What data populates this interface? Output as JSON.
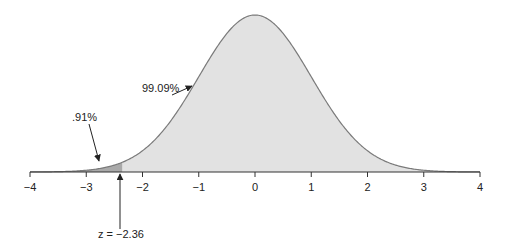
{
  "chart_data": {
    "type": "area",
    "title": "",
    "xlabel": "",
    "ylabel": "",
    "xlim": [
      -4,
      4
    ],
    "x_ticks": [
      -4,
      -3,
      -2,
      -1,
      0,
      1,
      2,
      3,
      4
    ],
    "tick_labels": [
      "−4",
      "−3",
      "−2",
      "−1",
      "0",
      "1",
      "2",
      "3",
      "4"
    ],
    "distribution": "standard normal",
    "z_cutoff": -2.36,
    "regions": [
      {
        "name": "left tail",
        "range": [
          -4,
          -2.36
        ],
        "percent": 0.91,
        "label": ".91%",
        "color": "#a9a9a9"
      },
      {
        "name": "body",
        "range": [
          -2.36,
          4
        ],
        "percent": 99.09,
        "label": "99.09%",
        "color": "#e2e2e2"
      }
    ],
    "grid": false,
    "legend": "none"
  },
  "annotations": {
    "tail_label": ".91%",
    "body_label": "99.09%",
    "z_label": "z = −2.36"
  },
  "colors": {
    "curve": "#7a7a7a",
    "body_fill": "#e2e2e2",
    "tail_fill": "#a9a9a9",
    "axis": "#333333"
  }
}
